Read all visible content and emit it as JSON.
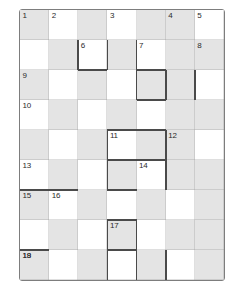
{
  "puzzle": {
    "title": "Crossword Grid",
    "type": "crossword-grid",
    "columns": 7,
    "rows": 9,
    "cell_width": 29.142,
    "cell_height": 30,
    "colors": {
      "background": "#ffffff",
      "shaded_cell": "#e4e4e4",
      "empty_cell": "#ffffff",
      "frame_stroke": "#7d7d7d",
      "word_boundary_stroke": "#4a4a4a",
      "grid_hairline": "rgba(150,150,150,0.30)",
      "number_text": "#2b2b2b"
    },
    "shading_pattern": "checkerboard",
    "shaded_cells": [
      [
        0,
        0
      ],
      [
        0,
        2
      ],
      [
        0,
        4
      ],
      [
        0,
        5
      ],
      [
        1,
        1
      ],
      [
        1,
        3
      ],
      [
        1,
        5
      ],
      [
        1,
        6
      ],
      [
        2,
        0
      ],
      [
        2,
        2
      ],
      [
        2,
        4
      ],
      [
        2,
        5
      ],
      [
        3,
        1
      ],
      [
        3,
        3
      ],
      [
        3,
        5
      ],
      [
        3,
        6
      ],
      [
        4,
        0
      ],
      [
        4,
        2
      ],
      [
        4,
        4
      ],
      [
        4,
        5
      ],
      [
        5,
        1
      ],
      [
        5,
        3
      ],
      [
        5,
        5
      ],
      [
        5,
        6
      ],
      [
        6,
        0
      ],
      [
        6,
        2
      ],
      [
        6,
        4
      ],
      [
        6,
        6
      ],
      [
        7,
        1
      ],
      [
        7,
        3
      ],
      [
        7,
        5
      ],
      [
        7,
        6
      ],
      [
        8,
        0
      ],
      [
        8,
        2
      ],
      [
        8,
        4
      ],
      [
        8,
        6
      ]
    ],
    "clue_numbers": [
      {
        "number": "1",
        "row": 0,
        "col": 0
      },
      {
        "number": "2",
        "row": 0,
        "col": 1
      },
      {
        "number": "3",
        "row": 0,
        "col": 3
      },
      {
        "number": "4",
        "row": 0,
        "col": 5
      },
      {
        "number": "5",
        "row": 0,
        "col": 6
      },
      {
        "number": "6",
        "row": 1,
        "col": 2
      },
      {
        "number": "7",
        "row": 1,
        "col": 4
      },
      {
        "number": "8",
        "row": 1,
        "col": 6
      },
      {
        "number": "9",
        "row": 2,
        "col": 0
      },
      {
        "number": "10",
        "row": 3,
        "col": 0
      },
      {
        "number": "11",
        "row": 4,
        "col": 3
      },
      {
        "number": "12",
        "row": 4,
        "col": 5
      },
      {
        "number": "13",
        "row": 5,
        "col": 0
      },
      {
        "number": "14",
        "row": 5,
        "col": 4
      },
      {
        "number": "15",
        "row": 6,
        "col": 0
      },
      {
        "number": "16",
        "row": 6,
        "col": 1
      },
      {
        "number": "17",
        "row": 7,
        "col": 3
      },
      {
        "number": "18",
        "row": 8,
        "col": 0
      },
      {
        "number": "19",
        "row": 8,
        "col": 0
      }
    ],
    "clue_number_placements": [
      {
        "number": "1",
        "row": 0,
        "col": 0
      },
      {
        "number": "2",
        "row": 0,
        "col": 1
      },
      {
        "number": "3",
        "row": 0,
        "col": 3
      },
      {
        "number": "4",
        "row": 0,
        "col": 5
      },
      {
        "number": "5",
        "row": 0,
        "col": 6
      },
      {
        "number": "6",
        "row": 1,
        "col": 2
      },
      {
        "number": "7",
        "row": 1,
        "col": 4
      },
      {
        "number": "8",
        "row": 1,
        "col": 6
      },
      {
        "number": "9",
        "row": 2,
        "col": 0
      },
      {
        "number": "10",
        "row": 3,
        "col": 0
      },
      {
        "number": "11",
        "row": 4,
        "col": 3
      },
      {
        "number": "12",
        "row": 4,
        "col": 5
      },
      {
        "number": "13",
        "row": 5,
        "col": 0
      },
      {
        "number": "14",
        "row": 5,
        "col": 4
      },
      {
        "number": "15",
        "row": 6,
        "col": 0
      },
      {
        "number": "16",
        "row": 6,
        "col": 1
      },
      {
        "number": "17",
        "row": 7,
        "col": 3
      },
      {
        "number": "18",
        "row": 8,
        "col": 0
      },
      {
        "number": "19",
        "row": 8,
        "col": 0
      }
    ],
    "word_boundaries": [
      {
        "orientation": "v",
        "row": 1,
        "col": 2,
        "side": "left"
      },
      {
        "orientation": "v",
        "row": 1,
        "col": 2,
        "side": "right"
      },
      {
        "orientation": "h",
        "row": 1,
        "col": 2,
        "side": "bottom"
      },
      {
        "orientation": "v",
        "row": 1,
        "col": 4,
        "side": "left"
      },
      {
        "orientation": "h",
        "row": 1,
        "col": 4,
        "side": "bottom"
      },
      {
        "orientation": "v",
        "row": 2,
        "col": 4,
        "side": "left"
      },
      {
        "orientation": "v",
        "row": 2,
        "col": 4,
        "side": "right"
      },
      {
        "orientation": "h",
        "row": 2,
        "col": 4,
        "side": "bottom"
      },
      {
        "orientation": "v",
        "row": 2,
        "col": 5,
        "side": "right"
      },
      {
        "orientation": "h",
        "row": 3,
        "col": 4,
        "side": "bottom"
      },
      {
        "orientation": "v",
        "row": 4,
        "col": 3,
        "side": "left"
      },
      {
        "orientation": "h",
        "row": 4,
        "col": 3,
        "side": "top"
      },
      {
        "orientation": "h",
        "row": 4,
        "col": 4,
        "side": "top"
      },
      {
        "orientation": "h",
        "row": 4,
        "col": 3,
        "side": "bottom"
      },
      {
        "orientation": "h",
        "row": 4,
        "col": 4,
        "side": "bottom"
      },
      {
        "orientation": "v",
        "row": 4,
        "col": 4,
        "side": "right"
      },
      {
        "orientation": "v",
        "row": 5,
        "col": 3,
        "side": "left"
      },
      {
        "orientation": "h",
        "row": 5,
        "col": 3,
        "side": "bottom"
      },
      {
        "orientation": "v",
        "row": 5,
        "col": 4,
        "side": "right"
      },
      {
        "orientation": "h",
        "row": 5,
        "col": 0,
        "side": "bottom"
      },
      {
        "orientation": "h",
        "row": 5,
        "col": 1,
        "side": "bottom"
      },
      {
        "orientation": "v",
        "row": 7,
        "col": 3,
        "side": "left"
      },
      {
        "orientation": "h",
        "row": 7,
        "col": 3,
        "side": "top"
      },
      {
        "orientation": "h",
        "row": 7,
        "col": 3,
        "side": "bottom"
      },
      {
        "orientation": "v",
        "row": 7,
        "col": 3,
        "side": "right"
      },
      {
        "orientation": "v",
        "row": 8,
        "col": 3,
        "side": "left"
      },
      {
        "orientation": "v",
        "row": 8,
        "col": 3,
        "side": "right"
      },
      {
        "orientation": "h",
        "row": 7,
        "col": 0,
        "side": "bottom"
      },
      {
        "orientation": "v",
        "row": 8,
        "col": 4,
        "side": "left"
      },
      {
        "orientation": "v",
        "row": 8,
        "col": 4,
        "side": "right"
      },
      {
        "orientation": "h",
        "row": 8,
        "col": 0,
        "side": "top"
      }
    ]
  }
}
